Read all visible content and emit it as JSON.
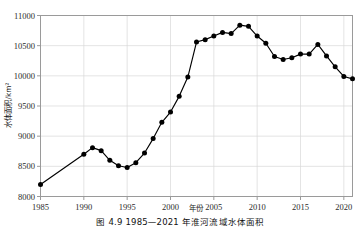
{
  "figure": {
    "caption": "图 4.9  1985—2021 年淮河流域水体面积"
  },
  "axes": {
    "y_title": "水体面积/km²",
    "x_title": "年份",
    "y_ticks": [
      "8000",
      "8500",
      "9000",
      "9500",
      "10000",
      "10500",
      "11000"
    ],
    "x_ticks": [
      "1985",
      "1990",
      "1995",
      "2000",
      "2005",
      "2010",
      "2015",
      "2020"
    ]
  },
  "style": {
    "line_color": "#000000",
    "marker_color": "#000000",
    "grid_color": "#d9d9d9",
    "frame_color": "#9a9a9a"
  },
  "chart_data": {
    "type": "line",
    "title": "图 4.9  1985—2021 年淮河流域水体面积",
    "xlabel": "年份",
    "ylabel": "水体面积/km²",
    "xlim": [
      1985,
      2021
    ],
    "ylim": [
      8000,
      11000
    ],
    "ytick_interval": 500,
    "xtick_interval": 5,
    "grid": true,
    "legend": null,
    "marker": "filled-circle",
    "x": [
      1985,
      1990,
      1991,
      1992,
      1993,
      1994,
      1995,
      1996,
      1997,
      1998,
      1999,
      2000,
      2001,
      2002,
      2003,
      2004,
      2005,
      2006,
      2007,
      2008,
      2009,
      2010,
      2011,
      2012,
      2013,
      2014,
      2015,
      2016,
      2017,
      2018,
      2019,
      2020,
      2021
    ],
    "values": [
      8200,
      8700,
      8810,
      8760,
      8600,
      8510,
      8480,
      8560,
      8720,
      8960,
      9230,
      9400,
      9660,
      9980,
      10560,
      10600,
      10660,
      10720,
      10700,
      10840,
      10820,
      10660,
      10540,
      10320,
      10270,
      10300,
      10360,
      10360,
      10520,
      10330,
      10150,
      9990,
      9950
    ]
  }
}
